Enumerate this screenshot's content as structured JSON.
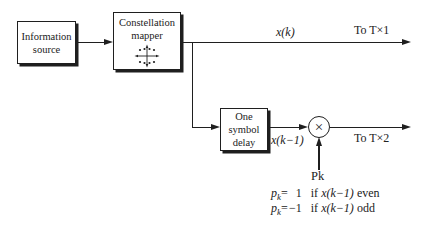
{
  "canvas": {
    "background": "#ffffff",
    "ink": "#1f1f1f"
  },
  "blocks": {
    "information_source": {
      "line1": "Information",
      "line2": "source"
    },
    "constellation_mapper": {
      "line1": "Constellation",
      "line2": "mapper"
    },
    "one_symbol_delay": {
      "line1": "One",
      "line2": "symbol",
      "line3": "delay"
    }
  },
  "multiplier": {
    "symbol": "×"
  },
  "labels": {
    "x_k": "x(k)",
    "x_k_minus_1": "x(k−1)",
    "to_tx1": "To T×1",
    "to_tx2": "To T×2",
    "pk": "Pk"
  },
  "equations": {
    "line1": {
      "var": "p",
      "sub": "k",
      "eq": "=",
      "value": "1",
      "if": "if",
      "expr": "x(k−1)",
      "parity": "even"
    },
    "line2": {
      "var": "p",
      "sub": "k",
      "eq": "=",
      "value": "−1",
      "if": "if",
      "expr": "x(k−1)",
      "parity": "odd"
    }
  }
}
